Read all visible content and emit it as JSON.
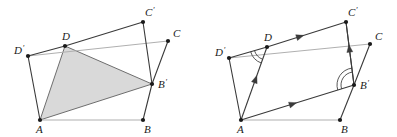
{
  "figure": {
    "background_color": "#ffffff",
    "stroke_color": "#3a3a3a",
    "light_stroke_color": "#b0b0b0",
    "shade_fill_color": "#d9d9d9",
    "shade_stroke_color": "#6e6e6e",
    "point_color": "#1a1a1a",
    "label_color": "#1a1a1a"
  },
  "panels": [
    {
      "id": "left-panel",
      "name": "shaded-quadrilateral-panel",
      "description": "Quadrilateral A D B' with shaded region A D B' and outer frame points",
      "points": [
        {
          "key": "A",
          "label": "A",
          "prime": false,
          "x": 40,
          "y": 120,
          "label_dx": -4,
          "label_dy": 13
        },
        {
          "key": "B",
          "label": "B",
          "prime": false,
          "x": 143,
          "y": 120,
          "label_dx": 1,
          "label_dy": 13
        },
        {
          "key": "C",
          "label": "C",
          "prime": false,
          "x": 168,
          "y": 41,
          "label_dx": 5,
          "label_dy": -4
        },
        {
          "key": "D",
          "label": "D",
          "prime": false,
          "x": 65,
          "y": 46,
          "label_dx": -3,
          "label_dy": -6
        },
        {
          "key": "Ap",
          "label": "A",
          "prime": true,
          "x": 40,
          "y": 120,
          "label_dx": -4,
          "label_dy": 13,
          "hidden": true
        },
        {
          "key": "Bp",
          "label": "B",
          "prime": true,
          "x": 152,
          "y": 84,
          "label_dx": 6,
          "label_dy": 4
        },
        {
          "key": "Cp",
          "label": "C",
          "prime": true,
          "x": 143,
          "y": 22,
          "label_dx": 2,
          "label_dy": -6
        },
        {
          "key": "Dp",
          "label": "D",
          "prime": true,
          "x": 28,
          "y": 56,
          "label_dx": -14,
          "label_dy": -2
        }
      ],
      "light_segments": [
        {
          "name": "segment-A-B",
          "from": "A",
          "to": "B"
        },
        {
          "name": "segment-Dp-C",
          "from": "Dp",
          "to": "C"
        }
      ],
      "segments": [
        {
          "name": "segment-A-Dp",
          "from": "A",
          "to": "Dp"
        },
        {
          "name": "segment-Dp-D",
          "from": "Dp",
          "to": "D"
        },
        {
          "name": "segment-D-Cp",
          "from": "D",
          "to": "Cp"
        },
        {
          "name": "segment-Cp-Bp",
          "from": "Cp",
          "to": "Bp"
        },
        {
          "name": "segment-Bp-B",
          "from": "Bp",
          "to": "B"
        },
        {
          "name": "segment-C-Bp",
          "from": "C",
          "to": "Bp"
        }
      ],
      "shaded_polygon": {
        "name": "shaded-triangle-A-D-Bp",
        "vertices": [
          "A",
          "D",
          "Bp"
        ]
      },
      "arrows": [],
      "angle_arcs": []
    },
    {
      "id": "right-panel",
      "name": "vector-annotated-quadrilateral-panel",
      "description": "Same construction with parallel direction arrows and equal angle arcs at D and B'",
      "points": [
        {
          "key": "A",
          "label": "A",
          "prime": false,
          "x": 43,
          "y": 120,
          "label_dx": -4,
          "label_dy": 13
        },
        {
          "key": "B",
          "label": "B",
          "prime": false,
          "x": 142,
          "y": 120,
          "label_dx": 1,
          "label_dy": 13
        },
        {
          "key": "C",
          "label": "C",
          "prime": false,
          "x": 172,
          "y": 44,
          "label_dx": 5,
          "label_dy": -4
        },
        {
          "key": "D",
          "label": "D",
          "prime": false,
          "x": 69,
          "y": 47,
          "label_dx": -3,
          "label_dy": -6
        },
        {
          "key": "Bp",
          "label": "B",
          "prime": true,
          "x": 156,
          "y": 85,
          "label_dx": 6,
          "label_dy": 4
        },
        {
          "key": "Cp",
          "label": "C",
          "prime": true,
          "x": 148,
          "y": 22,
          "label_dx": 2,
          "label_dy": -6
        },
        {
          "key": "Dp",
          "label": "D",
          "prime": true,
          "x": 31,
          "y": 58,
          "label_dx": -14,
          "label_dy": -2
        }
      ],
      "light_segments": [
        {
          "name": "segment-A-B",
          "from": "A",
          "to": "B"
        },
        {
          "name": "segment-Dp-C",
          "from": "Dp",
          "to": "C"
        }
      ],
      "segments": [
        {
          "name": "segment-A-Dp",
          "from": "A",
          "to": "Dp"
        },
        {
          "name": "segment-Dp-D",
          "from": "Dp",
          "to": "D"
        },
        {
          "name": "segment-Cp-Bp",
          "from": "Cp",
          "to": "Bp"
        },
        {
          "name": "segment-Bp-B",
          "from": "Bp",
          "to": "B"
        },
        {
          "name": "segment-C-Bp",
          "from": "C",
          "to": "Bp"
        }
      ],
      "arrows": [
        {
          "name": "vector-D-to-Cp",
          "from": "D",
          "to": "Cp",
          "head_at": 0.42
        },
        {
          "name": "vector-A-to-Bp",
          "from": "A",
          "to": "Bp",
          "head_at": 0.46
        },
        {
          "name": "vector-A-to-D",
          "from": "A",
          "to": "D",
          "head_at": 0.56
        },
        {
          "name": "vector-B-to-Cp",
          "from": "Bp",
          "to": "Cp",
          "head_at": 0.58
        }
      ],
      "angle_arcs": [
        {
          "name": "angle-arc-at-D",
          "vertex": "D",
          "arm1": "Dp",
          "arm2": "A",
          "radii": [
            13,
            17
          ]
        },
        {
          "name": "angle-arc-at-Bp",
          "vertex": "Bp",
          "arm1": "A",
          "arm2": "Cp",
          "radii": [
            13,
            17
          ]
        }
      ],
      "shaded_polygon": null
    }
  ]
}
